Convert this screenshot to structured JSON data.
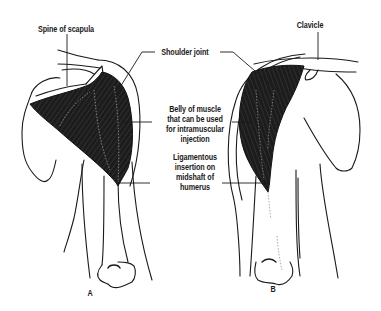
{
  "figure": {
    "labels": {
      "spine_of_scapula": "Spine of scapula",
      "shoulder_joint": "Shoulder joint",
      "clavicle": "Clavicle",
      "belly_of_muscle": [
        "Belly of muscle",
        "that can be used",
        "for intramuscular",
        "injection"
      ],
      "ligamentous_insertion": [
        "Ligamentous",
        "insertion on",
        "midshaft of",
        "humerus"
      ],
      "panel_a": "A",
      "panel_b": "B"
    },
    "colors": {
      "muscle": "#1c1c1c",
      "line": "#1a1a1a",
      "background": "#ffffff"
    }
  }
}
